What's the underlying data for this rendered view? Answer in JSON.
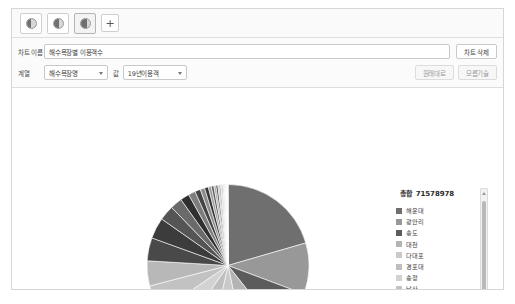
{
  "tabs": {
    "items": [
      {
        "name": "chart-tab-1",
        "icon": "pie-chart-icon",
        "active": false
      },
      {
        "name": "chart-tab-2",
        "icon": "pie-chart-icon",
        "active": false
      },
      {
        "name": "chart-tab-3",
        "icon": "pie-chart-icon",
        "active": true
      }
    ],
    "add_label": "+"
  },
  "controls": {
    "title_label": "차트 이름",
    "title_value": "해수욕장별 이용객수",
    "delete_label": "차트 삭제",
    "series_label": "계열",
    "series_value": "해수욕장명",
    "value_label": "값",
    "value_value": "19년이용객",
    "reset_label": "원래대로",
    "clearall_label": "모름기술"
  },
  "legend": {
    "total_label": "총합",
    "total_value": "71578978"
  },
  "chart_data": {
    "type": "pie",
    "total": 71578978,
    "legend_position": "right",
    "categories": [
      "해운대",
      "광안리",
      "송도",
      "대천",
      "다대포",
      "경포대",
      "송정",
      "낙산",
      "속초",
      "삼척",
      "망상"
    ],
    "values": [
      20.5,
      10.5,
      9.0,
      8.0,
      7.5,
      7.0,
      6.5,
      6.0,
      5.5,
      5.0,
      4.5
    ],
    "colors": [
      "#707070",
      "#9a9a9a",
      "#666666",
      "#b8b8b8",
      "#cccccc",
      "#c4c4c4",
      "#d4d4d4",
      "#dddddd",
      "#5f5f5f",
      "#4f4f4f",
      "#3f3f3f"
    ],
    "slices": [
      {
        "label": "해운대",
        "percent": 20.5,
        "color": "#6f6f6f"
      },
      {
        "label": "광안리",
        "percent": 10.2,
        "color": "#989898"
      },
      {
        "label": "송도",
        "percent": 8.6,
        "color": "#5c5c5c"
      },
      {
        "label": "대천",
        "percent": 7.4,
        "color": "#b4b4b4"
      },
      {
        "label": "다대포",
        "percent": 6.8,
        "color": "#c9c9c9"
      },
      {
        "label": "경포대",
        "percent": 6.2,
        "color": "#bebebe"
      },
      {
        "label": "송정",
        "percent": 5.8,
        "color": "#d2d2d2"
      },
      {
        "label": "낙산",
        "percent": 5.4,
        "color": "#c2c2c2"
      },
      {
        "label": "속초",
        "percent": 5.0,
        "color": "#b8b8b8"
      },
      {
        "label": "삼척",
        "percent": 4.6,
        "color": "#494949"
      },
      {
        "label": "망상",
        "percent": 4.2,
        "color": "#3c3c3c"
      },
      {
        "label": "기타1",
        "percent": 3.0,
        "color": "#555555"
      },
      {
        "label": "기타2",
        "percent": 2.4,
        "color": "#6a6a6a"
      },
      {
        "label": "기타3",
        "percent": 1.8,
        "color": "#2f2f2f"
      },
      {
        "label": "기타4",
        "percent": 1.4,
        "color": "#7d7d7d"
      },
      {
        "label": "기타5",
        "percent": 1.1,
        "color": "#444444"
      },
      {
        "label": "기타6",
        "percent": 0.9,
        "color": "#8d8d8d"
      },
      {
        "label": "기타7",
        "percent": 0.75,
        "color": "#343434"
      },
      {
        "label": "기타8",
        "percent": 0.6,
        "color": "#9e9e9e"
      },
      {
        "label": "기타9",
        "percent": 0.5,
        "color": "#5a5a5a"
      },
      {
        "label": "기타10",
        "percent": 0.42,
        "color": "#ababab"
      },
      {
        "label": "기타11",
        "percent": 0.36,
        "color": "#3a3a3a"
      },
      {
        "label": "기타12",
        "percent": 0.3,
        "color": "#bdbdbd"
      },
      {
        "label": "기타13",
        "percent": 0.26,
        "color": "#6d6d6d"
      },
      {
        "label": "기타14",
        "percent": 0.22,
        "color": "#cfcfcf"
      },
      {
        "label": "기타15",
        "percent": 0.19,
        "color": "#7a7a7a"
      },
      {
        "label": "기타16",
        "percent": 0.16,
        "color": "#dadada"
      },
      {
        "label": "기타17",
        "percent": 0.14,
        "color": "#8a8a8a"
      },
      {
        "label": "기타18",
        "percent": 0.12,
        "color": "#e2e2e2"
      },
      {
        "label": "기타19",
        "percent": 0.1,
        "color": "#9c9c9c"
      },
      {
        "label": "기타20",
        "percent": 0.09,
        "color": "#e8e8e8"
      },
      {
        "label": "기타21",
        "percent": 0.08,
        "color": "#aeaeae"
      },
      {
        "label": "기타22",
        "percent": 0.07,
        "color": "#efefef"
      },
      {
        "label": "기타23",
        "percent": 0.06,
        "color": "#bfbfbf"
      },
      {
        "label": "기타24",
        "percent": 0.05,
        "color": "#f2f2f2"
      },
      {
        "label": "기타25",
        "percent": 0.05,
        "color": "#cacaca"
      },
      {
        "label": "기타26",
        "percent": 0.04,
        "color": "#f5f5f5"
      },
      {
        "label": "기타27",
        "percent": 0.04,
        "color": "#d5d5d5"
      },
      {
        "label": "기타28",
        "percent": 0.03,
        "color": "#f8f8f8"
      },
      {
        "label": "기타29",
        "percent": 0.03,
        "color": "#dfdfdf"
      }
    ],
    "legend_items": [
      {
        "label": "해운대",
        "color": "#6f6f6f"
      },
      {
        "label": "광안리",
        "color": "#989898"
      },
      {
        "label": "송도",
        "color": "#5c5c5c"
      },
      {
        "label": "대천",
        "color": "#b4b4b4"
      },
      {
        "label": "다대포",
        "color": "#c9c9c9"
      },
      {
        "label": "경포대",
        "color": "#bebebe"
      },
      {
        "label": "송정",
        "color": "#d2d2d2"
      },
      {
        "label": "낙산",
        "color": "#c2c2c2"
      },
      {
        "label": "속초",
        "color": "#5f5f5f"
      },
      {
        "label": "삼척",
        "color": "#494949"
      },
      {
        "label": "망상",
        "color": "#3c3c3c"
      }
    ]
  }
}
